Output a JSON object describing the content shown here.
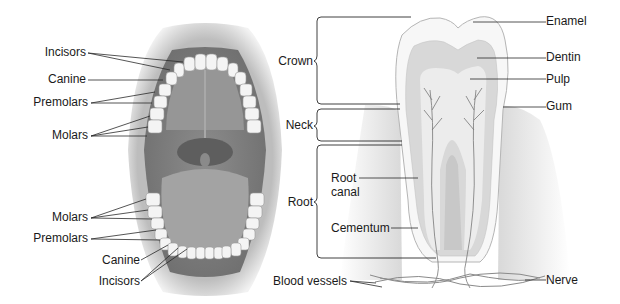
{
  "diagram": {
    "type": "anatomy-illustration",
    "panels": [
      {
        "id": "mouth",
        "description": "Open mouth showing upper and lower dental arches",
        "upper_labels": [
          "Incisors",
          "Canine",
          "Premolars",
          "Molars"
        ],
        "lower_labels": [
          "Molars",
          "Premolars",
          "Canine",
          "Incisors"
        ]
      },
      {
        "id": "tooth",
        "description": "Longitudinal section of a molar tooth in the gum",
        "region_labels": [
          "Crown",
          "Neck",
          "Root"
        ],
        "structure_labels": [
          "Enamel",
          "Dentin",
          "Pulp",
          "Gum",
          "Root canal",
          "Cementum",
          "Blood vessels",
          "Nerve"
        ]
      }
    ]
  },
  "labels": {
    "mouth_upper": {
      "incisors": "Incisors",
      "canine": "Canine",
      "premolars": "Premolars",
      "molars": "Molars"
    },
    "mouth_lower": {
      "molars": "Molars",
      "premolars": "Premolars",
      "canine": "Canine",
      "incisors": "Incisors"
    },
    "tooth": {
      "crown": "Crown",
      "neck": "Neck",
      "root": "Root",
      "enamel": "Enamel",
      "dentin": "Dentin",
      "pulp": "Pulp",
      "gum": "Gum",
      "root_canal_1": "Root",
      "root_canal_2": "canal",
      "cementum": "Cementum",
      "blood_vessels": "Blood vessels",
      "nerve": "Nerve"
    }
  },
  "colors": {
    "line": "#2a2a2a",
    "lips": "#c9c9c9",
    "mouth_interior": "#8a8a8a",
    "tongue": "#a5a5a5",
    "teeth": "#f4f4f4",
    "enamel": "#f7f7f7",
    "dentin": "#d9d9d9",
    "pulp": "#ececec",
    "gum": "#dcdcdc"
  }
}
